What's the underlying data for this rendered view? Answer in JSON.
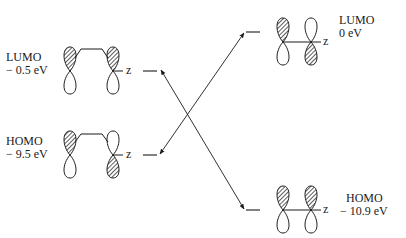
{
  "diagram": {
    "type": "frontier-molecular-orbital-interaction",
    "left": {
      "lumo": {
        "name": "LUMO",
        "energy": "− 0.5 eV",
        "axis": "z"
      },
      "homo": {
        "name": "HOMO",
        "energy": "− 9.5 eV",
        "axis": "z"
      }
    },
    "right": {
      "lumo": {
        "name": "LUMO",
        "energy": "0 eV",
        "axis": "z"
      },
      "homo": {
        "name": "HOMO",
        "energy": "− 10.9 eV",
        "axis": "z"
      }
    },
    "interactions": [
      {
        "from": "left.homo",
        "to": "right.lumo",
        "style": "double-arrow"
      },
      {
        "from": "left.lumo",
        "to": "right.homo",
        "style": "double-arrow"
      }
    ],
    "colors": {
      "ink": "#1a1a1a",
      "shading": "#555555"
    }
  }
}
